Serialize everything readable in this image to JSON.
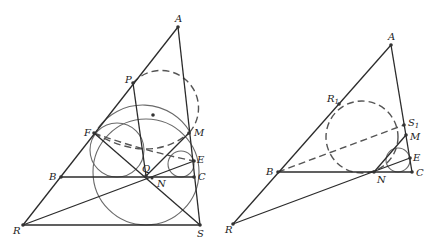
{
  "left_figure": {
    "labels": {
      "A": "A",
      "P": "P",
      "F": "F",
      "M": "M",
      "E": "E",
      "B": "B",
      "Q": "Q",
      "N": "N",
      "C": "C",
      "R": "R",
      "S": "S"
    }
  },
  "right_figure": {
    "labels": {
      "A": "A",
      "R1": "R",
      "R1_sub": "1",
      "S1": "S",
      "S1_sub": "1",
      "M": "M",
      "E": "E",
      "B": "B",
      "N": "N",
      "C": "C",
      "R": "R"
    }
  },
  "colors": {
    "line": "#2b2b2b",
    "circle": "#6a6a6a",
    "dashed": "#555555",
    "background": "#ffffff"
  }
}
